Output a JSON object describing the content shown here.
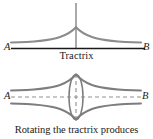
{
  "figure_top": {
    "name": "tractrix-curve",
    "caption": "Tractrix",
    "left_endpoint_label": "A",
    "right_endpoint_label": "B",
    "axis_color": "#1a1a1a",
    "curve_color": "#8c8c8c",
    "asymptote_color": "#6b6b6b",
    "description": "A tractrix curve with a cusp at the top of a vertical asymptote, approaching the horizontal axis AB on both sides"
  },
  "figure_bottom": {
    "name": "pseudosphere-surface",
    "caption": "Rotating the tractrix produces",
    "left_endpoint_label": "A",
    "right_endpoint_label": "B",
    "outline_color": "#7d7d7d",
    "dashed_color": "#8f8f8f",
    "description": "Surface of revolution generated by rotating the tractrix about axis AB, shown with dashed axis lines and a central ellipse cross-section"
  },
  "page": {
    "background_color": "#ffffff"
  }
}
